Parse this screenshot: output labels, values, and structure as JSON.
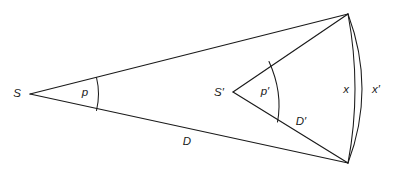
{
  "diagram": {
    "background_color": "#ffffff",
    "stroke_color": "#1a1a1a",
    "width": 397,
    "height": 179,
    "labels": {
      "source_left": "S",
      "source_right": "S′",
      "angle_left": "p",
      "angle_right": "p′",
      "distance_left": "D",
      "distance_right": "D′",
      "arc_inner": "x",
      "arc_outer": "x′"
    },
    "points": {
      "S": {
        "x": 30,
        "y": 94
      },
      "S_prime": {
        "x": 233,
        "y": 92
      },
      "top_vertex": {
        "x": 348,
        "y": 14
      },
      "bottom_vertex": {
        "x": 348,
        "y": 163
      }
    },
    "label_positions": {
      "S": {
        "x": 17,
        "y": 94
      },
      "S_prime": {
        "x": 214,
        "y": 93
      },
      "p": {
        "x": 82,
        "y": 93
      },
      "p_prime": {
        "x": 261,
        "y": 92
      },
      "D": {
        "x": 182,
        "y": 142
      },
      "D_prime": {
        "x": 295,
        "y": 122
      },
      "x": {
        "x": 343,
        "y": 90
      },
      "x_prime": {
        "x": 371,
        "y": 90
      }
    }
  }
}
